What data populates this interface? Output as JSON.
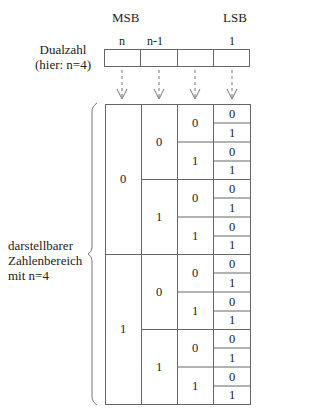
{
  "headers": {
    "msb": "MSB",
    "lsb": "LSB"
  },
  "bit_positions": [
    "n",
    "n-1",
    "",
    "1"
  ],
  "dual_label": {
    "line1": "Dualzahl",
    "line2": "(hier: n=4)"
  },
  "range_label": {
    "line1": "darstellbarer",
    "line2": "Zahlenbereich",
    "line3": "mit n=4"
  },
  "table": {
    "rows": 16,
    "columns": [
      {
        "level": 1,
        "values": [
          "0",
          "1"
        ]
      },
      {
        "level": 2,
        "values": [
          "0",
          "1",
          "0",
          "1"
        ]
      },
      {
        "level": 3,
        "values": [
          "0",
          "1",
          "0",
          "1",
          "0",
          "1",
          "0",
          "1"
        ]
      },
      {
        "level": 4,
        "values": [
          "0",
          "1",
          "0",
          "1",
          "0",
          "1",
          "0",
          "1",
          "0",
          "1",
          "0",
          "1",
          "0",
          "1",
          "0",
          "1"
        ]
      }
    ]
  },
  "colors": {
    "line": "#666666",
    "text": "#222222",
    "background": "#ffffff"
  }
}
